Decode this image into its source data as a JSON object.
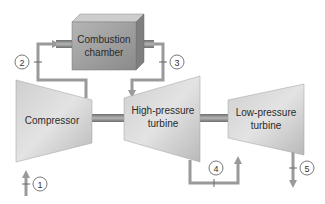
{
  "components": {
    "combustion_chamber": {
      "line1": "Combustion",
      "line2": "chamber"
    },
    "compressor": {
      "label": "Compressor"
    },
    "hp_turbine": {
      "line1": "High-pressure",
      "line2": "turbine"
    },
    "lp_turbine": {
      "line1": "Low-pressure",
      "line2": "turbine"
    }
  },
  "states": [
    "1",
    "2",
    "3",
    "4",
    "5"
  ],
  "colors": {
    "pipe": "#9a9a9a",
    "body_light": "#e2e2e2",
    "body_dark": "#b0b0b0",
    "chamber_front": "#9c9c9c",
    "chamber_top": "#c8c8c8",
    "chamber_side": "#7d7d7d",
    "shaft": "#7a7a7a",
    "text": "#2b2b2b"
  }
}
